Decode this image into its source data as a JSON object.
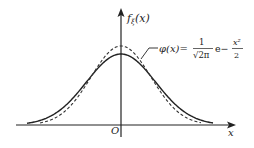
{
  "chart_data": {
    "type": "line",
    "title": "",
    "xlabel": "x",
    "ylabel": "f_ξ(x)",
    "origin_label": "O",
    "series": [
      {
        "name": "f_ξ(x)",
        "style": "solid",
        "sigma": 1.15,
        "peak_px_y": 54
      },
      {
        "name": "φ(x) = 1/√(2π) e^(-x²/2)",
        "style": "dashed",
        "sigma": 1.0,
        "peak_px_y": 46
      }
    ],
    "annotation": {
      "text_prefix": "φ(x)=",
      "numerator": "1",
      "denominator": "√2π",
      "exp_part": "e−",
      "exp_num": "x²",
      "exp_den": "2"
    }
  },
  "axes": {
    "y_label_main": "f",
    "y_label_sub": "ξ",
    "y_label_arg": "(x)",
    "x_label": "x",
    "origin": "O"
  }
}
